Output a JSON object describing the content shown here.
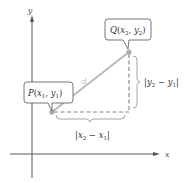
{
  "diagram": {
    "axes": {
      "x_label": "x",
      "y_label": "y",
      "color": "#555555"
    },
    "points": {
      "P": {
        "name": "P",
        "sub_x": "x",
        "sub_x_idx": "1",
        "sub_y": "y",
        "sub_y_idx": "1",
        "color": "#aaaaaa"
      },
      "Q": {
        "name": "Q",
        "sub_x": "x",
        "sub_x_idx": "2",
        "sub_y": "y",
        "sub_y_idx": "2",
        "color": "#aaaaaa"
      }
    },
    "segment": {
      "label": "d",
      "color": "#b5b5b5"
    },
    "dashed_color": "#8a8a8a",
    "brace_color": "#999999",
    "vertical_distance": {
      "bar": "|",
      "a": "y",
      "a_idx": "2",
      "minus": " − ",
      "b": "y",
      "b_idx": "1"
    },
    "horizontal_distance": {
      "bar": "|",
      "a": "x",
      "a_idx": "2",
      "minus": " − ",
      "b": "x",
      "b_idx": "1"
    },
    "text_color": "#333333"
  }
}
